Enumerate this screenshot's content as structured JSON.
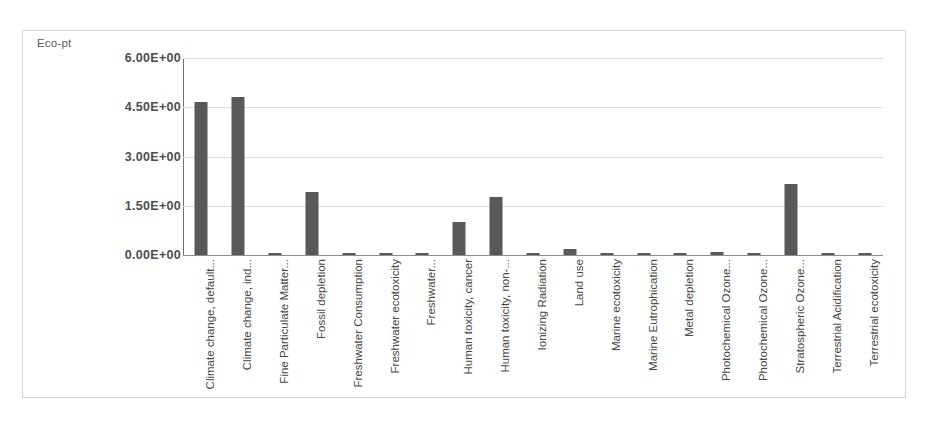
{
  "chart_data": {
    "type": "bar",
    "title": "",
    "subtitle": "",
    "ylabel": "Eco-pt",
    "xlabel": "",
    "ylim": [
      0,
      6
    ],
    "yticks": [
      0,
      1.5,
      3,
      4.5,
      6
    ],
    "ytick_labels": [
      "0.00E+00",
      "1.50E+00",
      "3.00E+00",
      "4.50E+00",
      "6.00E+00"
    ],
    "grid": true,
    "legend": false,
    "bar_color": "#595959",
    "categories": [
      "Climate change, default...",
      "Climate change, ind...",
      "Fine Particulate Matter...",
      "Fossil depletion",
      "Freshwater Consumption",
      "Freshwater ecotoxicity",
      "Freshwater...",
      "Human toxicity, cancer",
      "Human toxicity, non-...",
      "Ionizing Radiation",
      "Land use",
      "Marine ecotoxicity",
      "Marine Eutrophication",
      "Metal depletion",
      "Photochemical Ozone...",
      "Photochemical Ozone...",
      "Stratospheric Ozone...",
      "Terrestrial Acidification",
      "Terrestrial ecotoxicity"
    ],
    "values": [
      4.65,
      4.82,
      0.05,
      1.92,
      0.01,
      0.02,
      0.03,
      1.02,
      1.78,
      0.02,
      0.18,
      0.02,
      0.02,
      0.02,
      0.09,
      0.04,
      2.15,
      0.02,
      0.02
    ]
  },
  "axis": {
    "title": "Eco-pt"
  }
}
